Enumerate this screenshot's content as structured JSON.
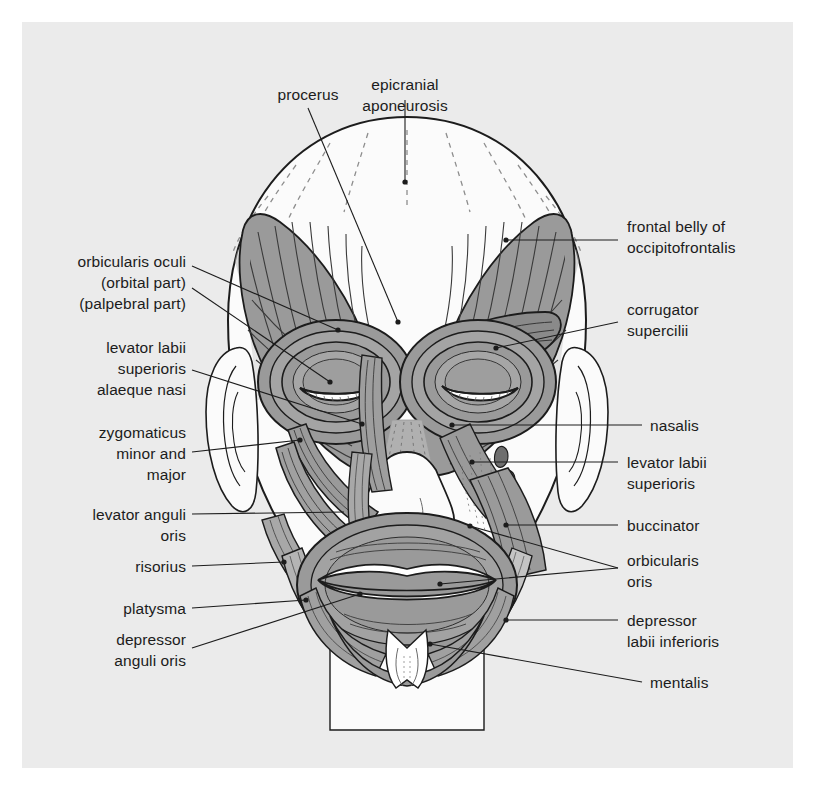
{
  "figure": {
    "panel_bg": "#ebebeb",
    "muscle_fill": "#9a9a9a",
    "muscle_fill_dark": "#7c7c7c",
    "muscle_fill_light": "#c9c9c9",
    "skin_fill": "#fbfbfb",
    "line_color": "#1c1c1c",
    "text_color": "#1c1c1c"
  },
  "labels": {
    "top": [
      {
        "id": "procerus",
        "text": "procerus",
        "align": "center",
        "x": 308,
        "y": 84
      },
      {
        "id": "epicranial-aponeurosis",
        "text": "epicranial\naponeurosis",
        "align": "center",
        "x": 405,
        "y": 74
      }
    ],
    "left": [
      {
        "id": "orbicularis-oculi",
        "text": "orbicularis oculi\n(orbital part)\n(palpebral part)",
        "align": "right",
        "x": 186,
        "y": 251
      },
      {
        "id": "levator-labii-superioris-alaeque-nasi",
        "text": "levator labii\nsuperioris\nalaeque nasi",
        "align": "right",
        "x": 186,
        "y": 337
      },
      {
        "id": "zygomaticus-minor-and-major",
        "text": "zygomaticus\nminor and\nmajor",
        "align": "right",
        "x": 186,
        "y": 422
      },
      {
        "id": "levator-anguli-oris",
        "text": "levator anguli\noris",
        "align": "right",
        "x": 186,
        "y": 504
      },
      {
        "id": "risorius",
        "text": "risorius",
        "align": "right",
        "x": 186,
        "y": 563
      },
      {
        "id": "platysma",
        "text": "platysma",
        "align": "right",
        "x": 186,
        "y": 605
      },
      {
        "id": "depressor-anguli-oris",
        "text": "depressor\nanguli oris",
        "align": "right",
        "x": 186,
        "y": 636
      }
    ],
    "right": [
      {
        "id": "frontal-belly-of-occipitofrontalis",
        "text": "frontal belly of\noccipitofrontalis",
        "align": "left",
        "x": 627,
        "y": 216
      },
      {
        "id": "corrugator-supercilii",
        "text": "corrugator\nsupercilii",
        "align": "left",
        "x": 627,
        "y": 299
      },
      {
        "id": "nasalis",
        "text": "nasalis",
        "align": "left",
        "x": 650,
        "y": 418
      },
      {
        "id": "levator-labii-superioris",
        "text": "levator labii\nsuperioris",
        "align": "left",
        "x": 627,
        "y": 455
      },
      {
        "id": "buccinator",
        "text": "buccinator",
        "align": "left",
        "x": 627,
        "y": 518
      },
      {
        "id": "orbicularis-oris",
        "text": "orbicularis\noris",
        "align": "left",
        "x": 627,
        "y": 553
      },
      {
        "id": "depressor-labii-inferioris",
        "text": "depressor\nlabii inferioris",
        "align": "left",
        "x": 627,
        "y": 613
      },
      {
        "id": "mentalis",
        "text": "mentalis",
        "align": "left",
        "x": 650,
        "y": 677
      }
    ]
  }
}
